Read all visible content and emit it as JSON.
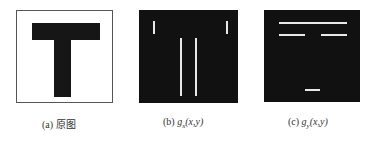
{
  "figures": [
    {
      "id": "a",
      "label": "(a)",
      "caption": "原图"
    },
    {
      "id": "b",
      "label": "(b)",
      "func": "g",
      "sub": "x",
      "args": "(x,y)"
    },
    {
      "id": "c",
      "label": "(c)",
      "func": "g",
      "sub": "y",
      "args": "(x,y)"
    }
  ]
}
